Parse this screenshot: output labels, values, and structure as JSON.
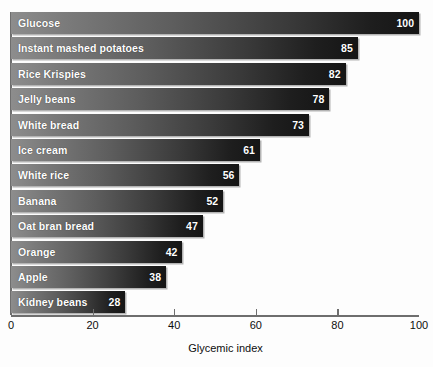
{
  "chart_data": {
    "type": "bar",
    "orientation": "horizontal",
    "title": "",
    "xlabel": "Glycemic index",
    "ylabel": "",
    "xlim": [
      0,
      100
    ],
    "xticks": [
      0,
      20,
      40,
      60,
      80,
      100
    ],
    "xtick_labels": [
      "0",
      "20",
      "40",
      "60",
      "80",
      "100"
    ],
    "grid": false,
    "legend": null,
    "categories": [
      "Glucose",
      "Instant mashed potatoes",
      "Rice Krispies",
      "Jelly beans",
      "White bread",
      "Ice cream",
      "White rice",
      "Banana",
      "Oat bran bread",
      "Orange",
      "Apple",
      "Kidney beans"
    ],
    "values": [
      100,
      85,
      82,
      78,
      73,
      61,
      56,
      52,
      47,
      42,
      38,
      28
    ],
    "bars": [
      {
        "label": "Glucose",
        "value": 100,
        "value_text": "100"
      },
      {
        "label": "Instant mashed potatoes",
        "value": 85,
        "value_text": "85"
      },
      {
        "label": "Rice Krispies",
        "value": 82,
        "value_text": "82"
      },
      {
        "label": "Jelly beans",
        "value": 78,
        "value_text": "78"
      },
      {
        "label": "White bread",
        "value": 73,
        "value_text": "73"
      },
      {
        "label": "Ice cream",
        "value": 61,
        "value_text": "61"
      },
      {
        "label": "White rice",
        "value": 56,
        "value_text": "56"
      },
      {
        "label": "Banana",
        "value": 52,
        "value_text": "52"
      },
      {
        "label": "Oat bran bread",
        "value": 47,
        "value_text": "47"
      },
      {
        "label": "Orange",
        "value": 42,
        "value_text": "42"
      },
      {
        "label": "Apple",
        "value": 38,
        "value_text": "38"
      },
      {
        "label": "Kidney beans",
        "value": 28,
        "value_text": "28"
      }
    ],
    "colors": {
      "bar_gradient_start": "#8d8d8d",
      "bar_gradient_end": "#151515",
      "bar_label_text": "#ffffff",
      "axis_line": "#6e6e6e",
      "axis_text": "#0d0d0d",
      "background": "#fdfdfd"
    }
  }
}
